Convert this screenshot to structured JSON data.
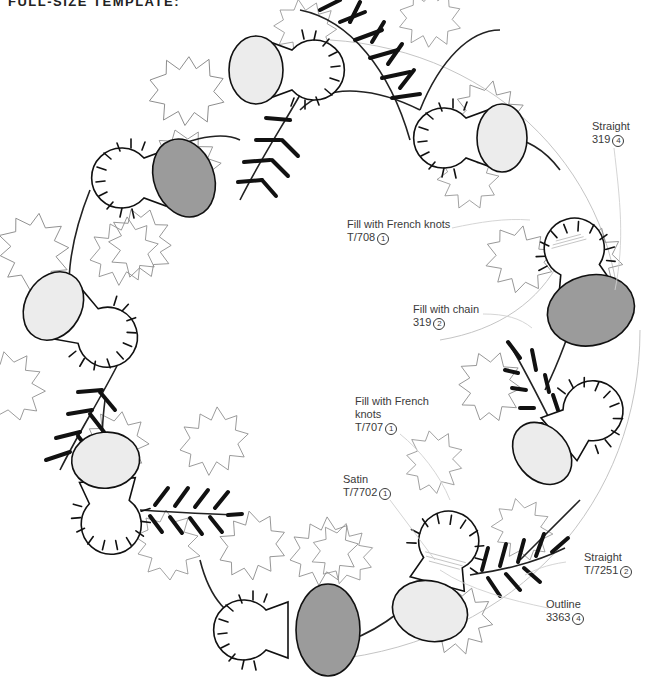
{
  "page": {
    "title": "FULL-SIZE TEMPLATE:"
  },
  "colors": {
    "dark_fill": "#9b9b9b",
    "light_fill": "#ececec",
    "outline": "#111111",
    "holly_outline": "#8a8a8a",
    "leader_line": "#d0d0d0",
    "label_text": "#3a3a3a"
  },
  "labels": [
    {
      "id": "straight-319",
      "line1": "Straight",
      "line2": "319",
      "num": "4"
    },
    {
      "id": "french-knots-708",
      "line1": "Fill with French knots",
      "line2": "T/708",
      "num": "1"
    },
    {
      "id": "chain-319",
      "line1": "Fill with chain",
      "line2": "319",
      "num": "2"
    },
    {
      "id": "french-knots-707",
      "line1": "Fill with French",
      "line1b": "knots",
      "line2": "T/707",
      "num": "1"
    },
    {
      "id": "satin-7702",
      "line1": "Satin",
      "line2": "T/7702",
      "num": "1"
    },
    {
      "id": "straight-7251",
      "line1": "Straight",
      "line2": "T/7251",
      "num": "2"
    },
    {
      "id": "outline-3363",
      "line1": "Outline",
      "line2": "3363",
      "num": "4"
    }
  ]
}
